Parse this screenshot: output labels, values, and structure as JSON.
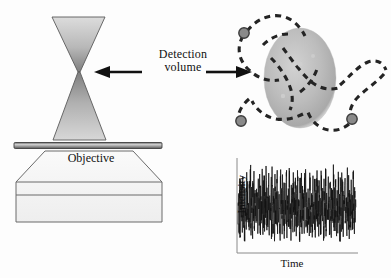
{
  "figure": {
    "labels": {
      "detection_volume_line1": "Detection",
      "detection_volume_line2": "volume",
      "objective": "Objective"
    },
    "icons": {
      "arrow_left": "arrow-left-icon",
      "arrow_right": "arrow-right-icon",
      "cone_upper": "excitation-cone-upper",
      "cone_lower": "excitation-cone-lower",
      "coverslip": "coverslip-bar",
      "objective_body": "objective-lens-body",
      "cell": "cell-ellipse",
      "particles": "fluorescent-particle-dots",
      "tracks": "dashed-diffusion-tracks"
    },
    "colors": {
      "background": "#fdfdfd",
      "cone_fill_light": "#d8d8d8",
      "cone_fill_dark": "#8f8f8f",
      "outline": "#4a4a4a",
      "coverslip": "#555555",
      "objective_fill": "#f2f2f2",
      "cell_fill": "#bdbdbd",
      "particle_fill": "#8c8c8c",
      "track": "#2b2b2b",
      "arrow": "#111111",
      "trace": "#111111",
      "axis": "#777777",
      "text": "#111111"
    },
    "geometry": {
      "cone_top_y": 17,
      "cone_waist_y": 72,
      "cone_bottom_y": 140,
      "coverslip_y": 145,
      "objective_top_y": 150,
      "objective_bottom_y": 222
    }
  },
  "chart_data": {
    "type": "line",
    "title": "",
    "xlabel": "Time",
    "ylabel": "Intensity",
    "x_tick_labels": [],
    "y_tick_labels": [],
    "grid": false,
    "legend": null,
    "axis_frame": "left-and-bottom",
    "xlim": [
      0,
      240
    ],
    "ylim": [
      0,
      100
    ],
    "series": [
      {
        "name": "Fluorescence intensity fluctuations",
        "description": "Noisy photon-count time trace with burst-like spikes",
        "values": [
          42,
          55,
          31,
          68,
          24,
          74,
          39,
          61,
          28,
          80,
          45,
          33,
          70,
          22,
          58,
          48,
          36,
          76,
          29,
          64,
          41,
          53,
          26,
          72,
          38,
          82,
          31,
          59,
          44,
          27,
          67,
          35,
          78,
          23,
          62,
          49,
          30,
          71,
          40,
          56,
          25,
          69,
          47,
          34,
          75,
          21,
          60,
          43,
          52,
          79,
          28,
          65,
          37,
          73,
          32,
          57,
          46,
          81,
          24,
          63,
          39,
          50,
          77,
          29,
          66,
          42,
          35,
          70,
          26,
          84,
          44,
          31,
          58,
          48,
          22,
          72,
          40,
          61,
          33,
          76,
          27,
          54,
          45,
          68,
          36,
          23,
          80,
          41,
          59,
          30,
          74,
          47,
          34,
          64,
          25,
          71,
          52,
          38,
          78,
          28,
          56,
          43,
          66,
          32,
          83,
          37,
          49,
          24,
          69,
          45,
          60,
          29,
          75,
          40,
          53,
          31,
          72,
          46,
          26,
          62,
          39,
          81,
          34,
          57,
          48,
          23,
          70,
          44,
          36,
          77,
          27,
          65,
          41,
          51,
          30,
          73,
          47,
          85,
          33,
          59,
          42,
          25,
          68,
          38,
          55,
          28,
          79,
          45,
          32,
          61,
          49,
          22,
          74,
          40,
          63,
          35,
          71,
          26,
          57,
          46,
          82,
          31,
          66,
          43,
          24,
          70,
          39,
          54,
          29,
          76,
          48,
          34,
          60,
          41,
          23,
          69,
          52,
          37,
          80,
          27,
          64,
          45,
          33,
          72,
          42,
          58,
          30,
          77,
          47,
          25,
          67,
          38,
          56,
          43,
          83,
          28,
          62,
          35,
          71,
          49,
          26,
          59,
          44,
          32,
          75,
          40,
          53,
          22,
          68,
          46,
          31,
          78,
          37,
          65,
          24,
          55,
          48,
          70,
          33,
          41,
          60,
          29,
          84,
          45,
          36,
          73,
          27,
          63,
          50,
          23,
          69,
          42,
          57,
          34,
          76,
          44,
          30,
          66,
          39,
          52
        ]
      }
    ]
  }
}
